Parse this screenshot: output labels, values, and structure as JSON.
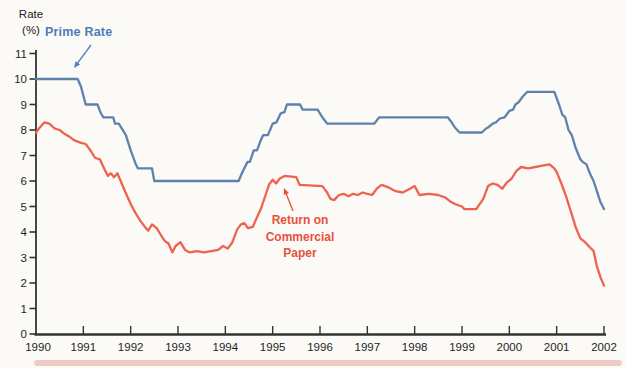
{
  "figure": {
    "y_axis_title_lines": [
      "Rate",
      "(%)"
    ],
    "annotations": {
      "prime_label": "Prime Rate",
      "commercial_label_lines": [
        "Return on",
        "Commercial",
        "Paper"
      ]
    },
    "colors": {
      "prime_line": "#5e82ac",
      "prime_label": "#4f7cba",
      "commercial_line": "#ee6350",
      "commercial_label": "#e5523d",
      "axis": "#333333",
      "tick_text": "#1f1f1f",
      "background": "#fbfaf6",
      "bottom_band": "#eec3bb"
    }
  },
  "chart_data": {
    "type": "line",
    "title": "",
    "xlabel": "",
    "ylabel": "Rate (%)",
    "xlim": [
      1990,
      2002
    ],
    "ylim": [
      0,
      11
    ],
    "x_ticks": [
      1990,
      1991,
      1992,
      1993,
      1994,
      1995,
      1996,
      1997,
      1998,
      1999,
      2000,
      2001,
      2002
    ],
    "y_ticks": [
      0,
      1,
      2,
      3,
      4,
      5,
      6,
      7,
      8,
      9,
      10,
      11
    ],
    "grid": false,
    "legend_position": "inline-annotations",
    "series": [
      {
        "name": "Prime Rate",
        "color": "#5e82ac",
        "points": [
          [
            1990.0,
            10
          ],
          [
            1990.88,
            10
          ],
          [
            1990.95,
            9.7
          ],
          [
            1991.05,
            9.0
          ],
          [
            1991.3,
            9.0
          ],
          [
            1991.36,
            8.7
          ],
          [
            1991.42,
            8.5
          ],
          [
            1991.63,
            8.5
          ],
          [
            1991.67,
            8.25
          ],
          [
            1991.75,
            8.25
          ],
          [
            1991.9,
            7.8
          ],
          [
            1992.0,
            7.2
          ],
          [
            1992.1,
            6.7
          ],
          [
            1992.15,
            6.5
          ],
          [
            1992.45,
            6.5
          ],
          [
            1992.5,
            6.0
          ],
          [
            1994.28,
            6.0
          ],
          [
            1994.35,
            6.3
          ],
          [
            1994.4,
            6.5
          ],
          [
            1994.47,
            6.75
          ],
          [
            1994.52,
            6.75
          ],
          [
            1994.6,
            7.2
          ],
          [
            1994.67,
            7.2
          ],
          [
            1994.75,
            7.6
          ],
          [
            1994.8,
            7.8
          ],
          [
            1994.9,
            7.8
          ],
          [
            1995.0,
            8.25
          ],
          [
            1995.08,
            8.3
          ],
          [
            1995.17,
            8.65
          ],
          [
            1995.25,
            8.7
          ],
          [
            1995.3,
            9.0
          ],
          [
            1995.58,
            9.0
          ],
          [
            1995.63,
            8.8
          ],
          [
            1995.95,
            8.8
          ],
          [
            1996.05,
            8.5
          ],
          [
            1996.15,
            8.25
          ],
          [
            1997.15,
            8.25
          ],
          [
            1997.25,
            8.5
          ],
          [
            1998.7,
            8.5
          ],
          [
            1998.78,
            8.3
          ],
          [
            1998.85,
            8.1
          ],
          [
            1998.95,
            7.9
          ],
          [
            1999.42,
            7.9
          ],
          [
            1999.5,
            8.05
          ],
          [
            1999.55,
            8.1
          ],
          [
            1999.65,
            8.25
          ],
          [
            1999.72,
            8.3
          ],
          [
            1999.8,
            8.45
          ],
          [
            1999.9,
            8.5
          ],
          [
            2000.0,
            8.75
          ],
          [
            2000.08,
            8.8
          ],
          [
            2000.13,
            9.0
          ],
          [
            2000.2,
            9.1
          ],
          [
            2000.28,
            9.3
          ],
          [
            2000.38,
            9.5
          ],
          [
            2000.95,
            9.5
          ],
          [
            2001.05,
            9.0
          ],
          [
            2001.12,
            8.6
          ],
          [
            2001.18,
            8.5
          ],
          [
            2001.25,
            8.0
          ],
          [
            2001.32,
            7.8
          ],
          [
            2001.4,
            7.3
          ],
          [
            2001.5,
            6.85
          ],
          [
            2001.55,
            6.75
          ],
          [
            2001.63,
            6.65
          ],
          [
            2001.7,
            6.3
          ],
          [
            2001.78,
            6.0
          ],
          [
            2001.85,
            5.6
          ],
          [
            2001.92,
            5.2
          ],
          [
            2002.0,
            4.9
          ]
        ]
      },
      {
        "name": "Return on Commercial Paper",
        "color": "#ee6350",
        "points": [
          [
            1990.0,
            7.9
          ],
          [
            1990.08,
            8.1
          ],
          [
            1990.18,
            8.3
          ],
          [
            1990.28,
            8.25
          ],
          [
            1990.4,
            8.05
          ],
          [
            1990.5,
            8.0
          ],
          [
            1990.6,
            7.85
          ],
          [
            1990.7,
            7.75
          ],
          [
            1990.8,
            7.6
          ],
          [
            1990.95,
            7.5
          ],
          [
            1991.05,
            7.45
          ],
          [
            1991.15,
            7.2
          ],
          [
            1991.25,
            6.9
          ],
          [
            1991.35,
            6.85
          ],
          [
            1991.45,
            6.45
          ],
          [
            1991.52,
            6.2
          ],
          [
            1991.58,
            6.3
          ],
          [
            1991.65,
            6.15
          ],
          [
            1991.72,
            6.3
          ],
          [
            1991.8,
            5.95
          ],
          [
            1991.88,
            5.6
          ],
          [
            1992.0,
            5.1
          ],
          [
            1992.1,
            4.75
          ],
          [
            1992.2,
            4.45
          ],
          [
            1992.3,
            4.2
          ],
          [
            1992.37,
            4.05
          ],
          [
            1992.45,
            4.3
          ],
          [
            1992.55,
            4.15
          ],
          [
            1992.65,
            3.85
          ],
          [
            1992.72,
            3.65
          ],
          [
            1992.8,
            3.55
          ],
          [
            1992.88,
            3.2
          ],
          [
            1992.95,
            3.45
          ],
          [
            1993.05,
            3.6
          ],
          [
            1993.15,
            3.3
          ],
          [
            1993.25,
            3.2
          ],
          [
            1993.4,
            3.25
          ],
          [
            1993.55,
            3.2
          ],
          [
            1993.7,
            3.25
          ],
          [
            1993.85,
            3.3
          ],
          [
            1993.95,
            3.45
          ],
          [
            1994.05,
            3.35
          ],
          [
            1994.15,
            3.6
          ],
          [
            1994.25,
            4.1
          ],
          [
            1994.33,
            4.3
          ],
          [
            1994.4,
            4.35
          ],
          [
            1994.48,
            4.15
          ],
          [
            1994.58,
            4.2
          ],
          [
            1994.65,
            4.5
          ],
          [
            1994.75,
            4.9
          ],
          [
            1994.85,
            5.45
          ],
          [
            1994.92,
            5.85
          ],
          [
            1995.0,
            6.05
          ],
          [
            1995.07,
            5.9
          ],
          [
            1995.15,
            6.1
          ],
          [
            1995.25,
            6.2
          ],
          [
            1995.5,
            6.15
          ],
          [
            1995.57,
            5.85
          ],
          [
            1996.05,
            5.8
          ],
          [
            1996.15,
            5.55
          ],
          [
            1996.22,
            5.3
          ],
          [
            1996.3,
            5.25
          ],
          [
            1996.4,
            5.45
          ],
          [
            1996.5,
            5.5
          ],
          [
            1996.6,
            5.4
          ],
          [
            1996.7,
            5.5
          ],
          [
            1996.8,
            5.45
          ],
          [
            1996.9,
            5.55
          ],
          [
            1997.0,
            5.5
          ],
          [
            1997.1,
            5.45
          ],
          [
            1997.2,
            5.7
          ],
          [
            1997.3,
            5.85
          ],
          [
            1997.45,
            5.75
          ],
          [
            1997.6,
            5.6
          ],
          [
            1997.75,
            5.55
          ],
          [
            1997.9,
            5.7
          ],
          [
            1998.0,
            5.8
          ],
          [
            1998.1,
            5.45
          ],
          [
            1998.3,
            5.5
          ],
          [
            1998.5,
            5.45
          ],
          [
            1998.65,
            5.35
          ],
          [
            1998.75,
            5.2
          ],
          [
            1998.85,
            5.1
          ],
          [
            1999.0,
            5.0
          ],
          [
            1999.05,
            4.9
          ],
          [
            1999.3,
            4.9
          ],
          [
            1999.45,
            5.3
          ],
          [
            1999.55,
            5.8
          ],
          [
            1999.65,
            5.9
          ],
          [
            1999.75,
            5.85
          ],
          [
            1999.85,
            5.7
          ],
          [
            1999.95,
            5.95
          ],
          [
            2000.05,
            6.1
          ],
          [
            2000.15,
            6.4
          ],
          [
            2000.25,
            6.55
          ],
          [
            2000.4,
            6.5
          ],
          [
            2000.55,
            6.55
          ],
          [
            2000.7,
            6.6
          ],
          [
            2000.85,
            6.65
          ],
          [
            2000.95,
            6.5
          ],
          [
            2001.0,
            6.35
          ],
          [
            2001.1,
            5.9
          ],
          [
            2001.2,
            5.4
          ],
          [
            2001.3,
            4.8
          ],
          [
            2001.4,
            4.2
          ],
          [
            2001.5,
            3.75
          ],
          [
            2001.6,
            3.6
          ],
          [
            2001.7,
            3.4
          ],
          [
            2001.78,
            3.25
          ],
          [
            2001.85,
            2.65
          ],
          [
            2001.93,
            2.2
          ],
          [
            2002.0,
            1.9
          ]
        ]
      }
    ]
  }
}
